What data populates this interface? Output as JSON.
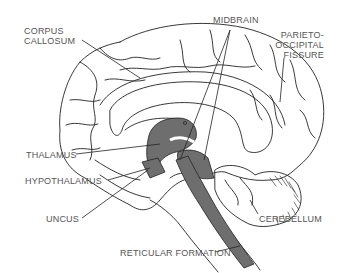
{
  "colors": {
    "outline": "#222222",
    "shaded": "#6e6e6e",
    "label": "#555555",
    "background": "#ffffff"
  },
  "labels": {
    "corpus_callosum": {
      "line1": "CORPUS",
      "line2": "CALLOSUM"
    },
    "midbrain": "MIDBRAIN",
    "parieto_occipital_fissure": {
      "line1": "PARIETO-",
      "line2": "OCCIPITAL",
      "line3": "FISSURE"
    },
    "thalamus": "THALAMUS",
    "hypothalamus": "HYPOTHALAMUS",
    "uncus": "UNCUS",
    "cerebellum": "CEREBELLUM",
    "reticular_formation": "RETICULAR FORMATION"
  }
}
